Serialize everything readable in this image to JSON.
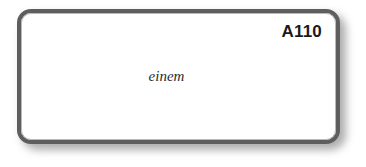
{
  "card": {
    "identifier": "A110",
    "word": "einem",
    "border_color": "#5e5e5e",
    "background_color": "#ffffff",
    "shadow_color": "#8e8e8e",
    "text_color": "#1a1a1a",
    "word_color": "#2b2b2b"
  },
  "page": {
    "background_color": "#ffffff"
  }
}
